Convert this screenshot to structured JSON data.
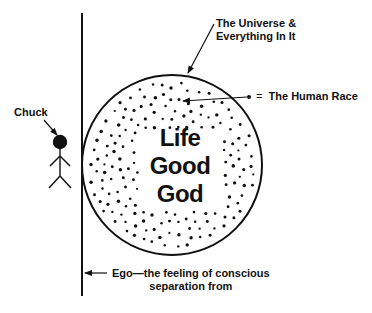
{
  "diagram": {
    "type": "conceptual-illustration",
    "colors": {
      "ink": "#111111",
      "background": "#ffffff"
    },
    "circle": {
      "label_lines": [
        "Life",
        "Good",
        "God"
      ],
      "dots_meaning": "The Human Race"
    },
    "labels": {
      "universe": [
        "The Universe &",
        "Everything In It"
      ],
      "human_race": {
        "symbol": "• =",
        "text": "The Human Race"
      },
      "person": "Chuck",
      "ego": [
        "Ego—the feeling of conscious",
        "separation from"
      ]
    }
  }
}
